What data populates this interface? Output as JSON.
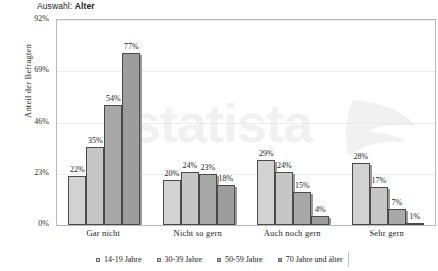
{
  "title": {
    "prefix": "Auswahl: ",
    "emphasis": "Alter"
  },
  "watermark": {
    "text": "statista"
  },
  "axis": {
    "y_label": "Anteil der Befragten",
    "y_ticks": [
      "0%",
      "23%",
      "46%",
      "69%",
      "92%"
    ]
  },
  "legend": {
    "items": [
      {
        "label": "14-19 Jahre",
        "color": "#d2d2d2"
      },
      {
        "label": "30-39 Jahre",
        "color": "#c6c6c6"
      },
      {
        "label": "50-59 Jahre",
        "color": "#a8a8a8"
      },
      {
        "label": "70 Jahre und älter",
        "color": "#9d9d9d"
      }
    ]
  },
  "chart_data": {
    "type": "bar",
    "title": "Auswahl: Alter",
    "xlabel": "",
    "ylabel": "Anteil der Befragten",
    "ylim": [
      0,
      92
    ],
    "yticks": [
      0,
      23,
      46,
      69,
      92
    ],
    "ytick_labels": [
      "0%",
      "23%",
      "46%",
      "69%",
      "92%"
    ],
    "grid": true,
    "legend_position": "bottom",
    "categories": [
      "Gar nicht",
      "Nicht so gern",
      "Auch noch gern",
      "Sehr gern"
    ],
    "series": [
      {
        "name": "14-19 Jahre",
        "values": [
          22,
          20,
          29,
          28
        ],
        "labels": [
          "22%",
          "20%",
          "29%",
          "28%"
        ],
        "color": "#d2d2d2"
      },
      {
        "name": "30-39 Jahre",
        "values": [
          35,
          24,
          24,
          17
        ],
        "labels": [
          "35%",
          "24%",
          "24%",
          "17%"
        ],
        "color": "#c6c6c6"
      },
      {
        "name": "50-59 Jahre",
        "values": [
          54,
          23,
          15,
          7
        ],
        "labels": [
          "54%",
          "23%",
          "15%",
          "7%"
        ],
        "color": "#a8a8a8"
      },
      {
        "name": "70 Jahre und älter",
        "values": [
          77,
          18,
          4,
          1
        ],
        "labels": [
          "77%",
          "18%",
          "4%",
          "1%"
        ],
        "color": "#9d9d9d"
      }
    ]
  }
}
